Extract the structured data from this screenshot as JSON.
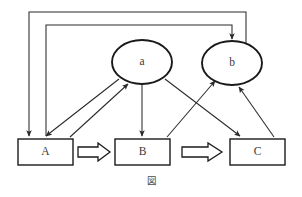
{
  "figure": {
    "caption": "図",
    "background_color": "#ffffff",
    "stroke_color": "#1a1a1a",
    "line_color": "#2a2a2a"
  },
  "nodes": [
    {
      "id": "A",
      "label": "A",
      "shape": "rectangle",
      "x": 18,
      "y": 139,
      "width": 55,
      "height": 26
    },
    {
      "id": "B",
      "label": "B",
      "shape": "rectangle",
      "x": 115,
      "y": 139,
      "width": 55,
      "height": 26
    },
    {
      "id": "C",
      "label": "C",
      "shape": "rectangle",
      "x": 230,
      "y": 139,
      "width": 55,
      "height": 26
    },
    {
      "id": "a",
      "label": "a",
      "shape": "ellipse",
      "cx": 142,
      "cy": 62,
      "rx": 30,
      "ry": 22
    },
    {
      "id": "b",
      "label": "b",
      "shape": "ellipse",
      "cx": 232,
      "cy": 63,
      "rx": 30,
      "ry": 22
    }
  ],
  "block_arrows": [
    {
      "id": "A-to-B",
      "from": "A",
      "to": "B",
      "x1": 78,
      "x2": 110,
      "y": 152
    },
    {
      "id": "B-to-C",
      "from": "B",
      "to": "C",
      "x1": 176,
      "x2": 225,
      "y": 152
    }
  ],
  "edges": [
    {
      "id": "a-to-A",
      "from": "a",
      "to": "A",
      "kind": "diagonal",
      "points": "119,79 46,136",
      "arrow_at": "A"
    },
    {
      "id": "A-to-a",
      "from": "A",
      "to": "a",
      "kind": "diagonal",
      "points": "70,137 128,84",
      "arrow_at": "a"
    },
    {
      "id": "a-to-B",
      "from": "a",
      "to": "B",
      "kind": "vertical",
      "points": "142,84 142,136",
      "arrow_at": "B"
    },
    {
      "id": "a-to-C",
      "from": "a",
      "to": "C",
      "kind": "diagonal",
      "points": "165,79 240,136",
      "arrow_at": "C"
    },
    {
      "id": "B-to-b",
      "from": "B",
      "to": "b",
      "kind": "diagonal",
      "points": "167,137 215,81",
      "arrow_at": "b"
    },
    {
      "id": "C-to-b",
      "from": "C",
      "to": "b",
      "kind": "diagonal",
      "points": "274,137 239,87",
      "arrow_at": "b"
    },
    {
      "id": "A-to-b",
      "from": "A",
      "to": "b",
      "kind": "orthogonal",
      "points": "46,136 46,25 232,25 232,39",
      "arrow_at": "b"
    },
    {
      "id": "b-to-A",
      "from": "b",
      "to": "A",
      "kind": "orthogonal",
      "points": "246,45 246,12 29,12 29,136",
      "arrow_at": "A"
    }
  ]
}
